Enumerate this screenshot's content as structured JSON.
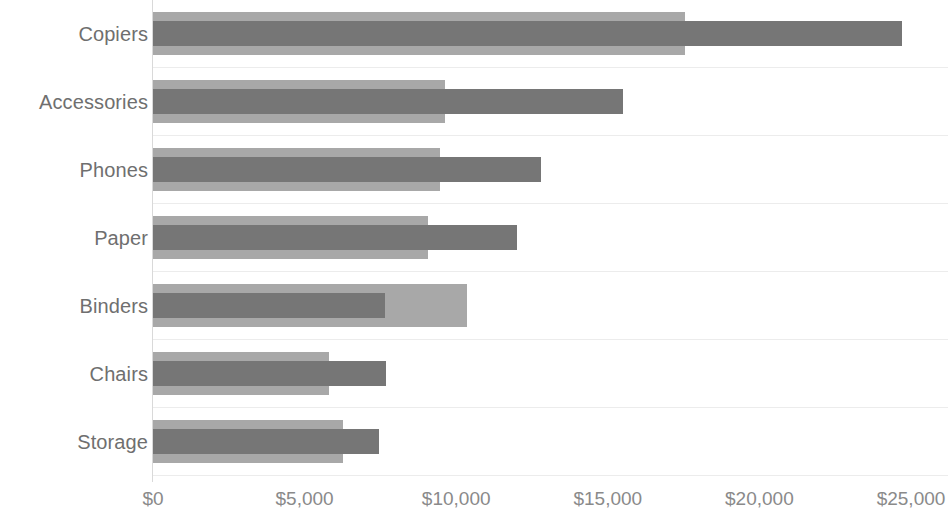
{
  "chart_data": {
    "type": "bar",
    "orientation": "horizontal",
    "title": "",
    "subtitle": "",
    "xlabel": "",
    "ylabel": "",
    "xlim": [
      0,
      25000
    ],
    "x_ticks": [
      0,
      5000,
      10000,
      15000,
      20000,
      25000
    ],
    "x_tick_labels": [
      "$0",
      "$5,000",
      "$10,000",
      "$15,000",
      "$20,000",
      "$25,000"
    ],
    "grid": true,
    "grid_orientation": "horizontal",
    "legend": false,
    "legend_position": "none",
    "categories": [
      "Copiers",
      "Accessories",
      "Phones",
      "Paper",
      "Binders",
      "Chairs",
      "Storage"
    ],
    "series": [
      {
        "name": "Background measure",
        "style": "wide-bar",
        "color": "#a8a8a8",
        "values": [
          17560,
          9620,
          9450,
          9060,
          10340,
          5800,
          6250
        ]
      },
      {
        "name": "Foreground measure",
        "style": "narrow-bar",
        "color": "#767676",
        "values": [
          24700,
          15510,
          12810,
          12000,
          7640,
          7670,
          7440
        ]
      }
    ]
  },
  "colors": {
    "background": "#ffffff",
    "bar_back": "#a8a8a8",
    "bar_front": "#767676",
    "axis_line": "#d9d9d9",
    "gridline": "#ececec",
    "category_label": "#6f6f6f",
    "tick_label": "#8a8a8a"
  }
}
